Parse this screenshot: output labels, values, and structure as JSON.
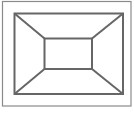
{
  "diagram": {
    "stroke_color": "#6b6b6b",
    "background": "#ffffff",
    "outer_border": {
      "x": 2,
      "y": 1,
      "w": 129,
      "h": 105
    },
    "outer_rect": {
      "x": 14,
      "y": 13,
      "w": 109,
      "h": 81
    },
    "inner_rect": {
      "x": 44,
      "y": 38,
      "w": 48,
      "h": 31
    }
  }
}
